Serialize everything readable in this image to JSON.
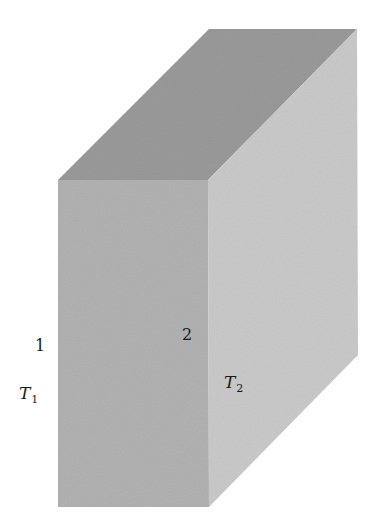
{
  "diagram": {
    "type": "3d-slab",
    "faces": {
      "top": {
        "color": "#9a9a9a"
      },
      "front": {
        "color": "#b2b2b2"
      },
      "right": {
        "color": "#cacaca"
      }
    },
    "labels": {
      "face1": {
        "text": "1"
      },
      "face2": {
        "text": "2"
      },
      "temp1": {
        "symbol": "T",
        "subscript": "1"
      },
      "temp2": {
        "symbol": "T",
        "subscript": "2"
      }
    }
  }
}
